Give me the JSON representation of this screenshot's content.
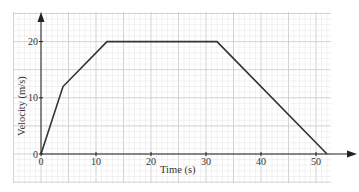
{
  "chart_data": {
    "type": "line",
    "title": "",
    "xlabel": "Time (s)",
    "ylabel": "Velocity (m/s)",
    "xlim": [
      0,
      52
    ],
    "ylim": [
      0,
      20
    ],
    "x_ticks": [
      "0",
      "10",
      "20",
      "30",
      "40",
      "50"
    ],
    "y_ticks": [
      "0",
      "10",
      "20"
    ],
    "grid": true,
    "legend": null,
    "series": [
      {
        "name": "velocity",
        "x": [
          0,
          4,
          12,
          32,
          52
        ],
        "y": [
          0,
          12,
          20,
          20,
          0
        ]
      }
    ]
  },
  "colors": {
    "line": "#333333",
    "grid_major": "#c8c8c8",
    "grid_minor": "#e4e4e4",
    "axis": "#222222"
  }
}
